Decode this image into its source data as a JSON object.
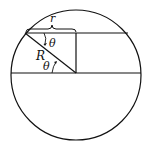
{
  "diagram": {
    "type": "geometry",
    "labels": {
      "r": "r",
      "R": "R",
      "theta_top": "θ",
      "theta_bottom": "θ"
    },
    "colors": {
      "stroke": "#111111",
      "background": "#ffffff"
    }
  }
}
